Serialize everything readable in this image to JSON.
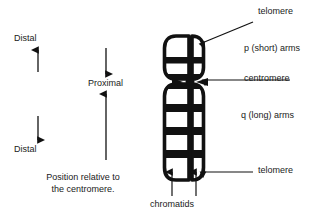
{
  "figure": {
    "title": "Chromosome structure and position relative to the centromere",
    "background_color": "#ffffff",
    "ink_color": "#000000",
    "text_color": "#1a1a1a"
  },
  "left_panel": {
    "caption_line1": "Position relative to",
    "caption_line2": "the centromere.",
    "labels": {
      "distal_top": "Distal",
      "distal_bottom": "Distal",
      "proximal": "Proximal"
    },
    "arrows": [
      {
        "name": "distal-up-arrow",
        "direction": "up",
        "meaning": "Distal (toward p telomere)"
      },
      {
        "name": "distal-down-arrow",
        "direction": "down",
        "meaning": "Distal (toward q telomere)"
      },
      {
        "name": "proximal-down-arrow",
        "direction": "down",
        "meaning": "Proximal (toward centromere from above)"
      },
      {
        "name": "proximal-up-arrow",
        "direction": "up",
        "meaning": "Proximal (toward centromere from below)"
      }
    ]
  },
  "chromosome": {
    "name": "metaphase-chromosome",
    "chromatid_count": 2,
    "p_arm_band_count": 2,
    "q_arm_band_count": 4,
    "centromere_position": "submetacentric"
  },
  "callouts": [
    {
      "id": "telomere-top",
      "label": "telomere",
      "pointer": "arrow",
      "target": "p-arm-tip"
    },
    {
      "id": "p-arms",
      "label": "p (short) arms",
      "pointer": "none",
      "target": "p-arms"
    },
    {
      "id": "centromere",
      "label": "centromere",
      "pointer": "arrow",
      "target": "centromere"
    },
    {
      "id": "q-arms",
      "label": "q (long) arms",
      "pointer": "none",
      "target": "q-arms"
    },
    {
      "id": "telomere-bottom",
      "label": "telomere",
      "pointer": "arrow",
      "target": "q-arm-tip"
    },
    {
      "id": "chromatids",
      "label": "chromatids",
      "pointer": "two-arrows",
      "target": "sister-chromatids"
    }
  ]
}
